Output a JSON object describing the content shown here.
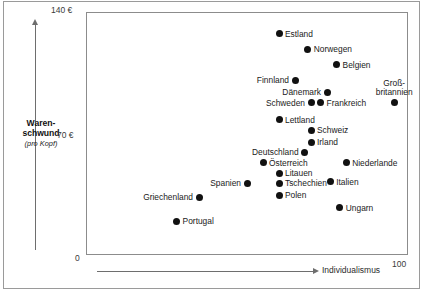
{
  "chart_data": {
    "type": "scatter",
    "title": "",
    "xlabel": "Individualismus",
    "ylabel": "Warenschwund (pro Kopf)",
    "ylabel_main": "Waren-\nschwund",
    "ylabel_sub": "(pro Kopf)",
    "xlim": [
      0,
      100
    ],
    "ylim": [
      0,
      140
    ],
    "x_ticks": [
      "100"
    ],
    "y_ticks": [
      "140 €",
      "70 €",
      "0"
    ],
    "grid": false,
    "legend": "none",
    "currency": "€",
    "points": [
      {
        "label": "Estland",
        "x": 60,
        "y": 128,
        "label_pos": "right"
      },
      {
        "label": "Norwegen",
        "x": 69,
        "y": 119,
        "label_pos": "right"
      },
      {
        "label": "Belgien",
        "x": 78,
        "y": 110,
        "label_pos": "right"
      },
      {
        "label": "Finnland",
        "x": 65,
        "y": 101,
        "label_pos": "left"
      },
      {
        "label": "Dänemark",
        "x": 75,
        "y": 94,
        "label_pos": "left"
      },
      {
        "label": "Groß-\nbritannien",
        "x": 96,
        "y": 88,
        "label_pos": "above"
      },
      {
        "label": "Frankreich",
        "x": 73,
        "y": 88,
        "label_pos": "right"
      },
      {
        "label": "Schweden",
        "x": 70,
        "y": 88,
        "label_pos": "left"
      },
      {
        "label": "Lettland",
        "x": 60,
        "y": 78,
        "label_pos": "right"
      },
      {
        "label": "Schweiz",
        "x": 70,
        "y": 72,
        "label_pos": "right"
      },
      {
        "label": "Irland",
        "x": 70,
        "y": 65,
        "label_pos": "right"
      },
      {
        "label": "Deutschland",
        "x": 68,
        "y": 59,
        "label_pos": "left"
      },
      {
        "label": "Österreich",
        "x": 55,
        "y": 53,
        "label_pos": "right"
      },
      {
        "label": "Niederlande",
        "x": 81,
        "y": 53,
        "label_pos": "right"
      },
      {
        "label": "Litauen",
        "x": 60,
        "y": 47,
        "label_pos": "right"
      },
      {
        "label": "Italien",
        "x": 76,
        "y": 42,
        "label_pos": "right"
      },
      {
        "label": "Tschechien",
        "x": 60,
        "y": 41,
        "label_pos": "right"
      },
      {
        "label": "Spanien",
        "x": 50,
        "y": 41,
        "label_pos": "left"
      },
      {
        "label": "Polen",
        "x": 60,
        "y": 34,
        "label_pos": "right"
      },
      {
        "label": "Griechenland",
        "x": 35,
        "y": 33,
        "label_pos": "left"
      },
      {
        "label": "Ungarn",
        "x": 79,
        "y": 27,
        "label_pos": "right"
      },
      {
        "label": "Portugal",
        "x": 28,
        "y": 19,
        "label_pos": "right"
      }
    ]
  },
  "axes": {
    "y_tick_top": "140 €",
    "y_tick_mid": "70 €",
    "y_tick_zero": "0",
    "x_tick_max": "100",
    "y_title_line1": "Waren-",
    "y_title_line2": "schwund",
    "y_title_sub": "(pro Kopf)",
    "x_title": "Individualismus"
  }
}
